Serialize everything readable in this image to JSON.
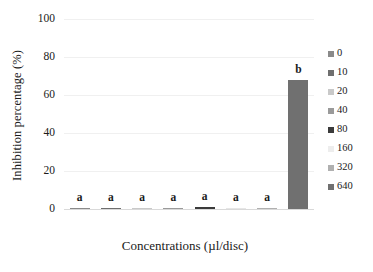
{
  "chart_data": {
    "type": "bar",
    "title": "",
    "xlabel": "Concentrations (µl/disc)",
    "ylabel": "Inhibition percentage (%)",
    "categories": [
      "0",
      "10",
      "20",
      "40",
      "80",
      "160",
      "320",
      "640"
    ],
    "values": [
      0.4,
      0.4,
      0.4,
      0.4,
      0.8,
      0.3,
      0.3,
      68
    ],
    "point_labels": [
      "a",
      "a",
      "a",
      "a",
      "a",
      "a",
      "a",
      "b"
    ],
    "bar_colors": [
      "#8a8a8a",
      "#6f6f6f",
      "#c9c9c9",
      "#9a9a9a",
      "#3b3b3b",
      "#e6e6e6",
      "#b0b0b0",
      "#707070"
    ],
    "ylim": [
      0,
      100
    ],
    "yticks": [
      "0",
      "20",
      "40",
      "60",
      "80",
      "100"
    ],
    "ytick_values": [
      0,
      20,
      40,
      60,
      80,
      100
    ],
    "grid": true,
    "legend_position": "right",
    "legend": [
      {
        "label": "0",
        "color": "#8a8a8a"
      },
      {
        "label": "10",
        "color": "#6f6f6f"
      },
      {
        "label": "20",
        "color": "#c9c9c9"
      },
      {
        "label": "40",
        "color": "#9a9a9a"
      },
      {
        "label": "80",
        "color": "#3b3b3b"
      },
      {
        "label": "160",
        "color": "#ededed"
      },
      {
        "label": "320",
        "color": "#b0b0b0"
      },
      {
        "label": "640",
        "color": "#707070"
      }
    ]
  }
}
